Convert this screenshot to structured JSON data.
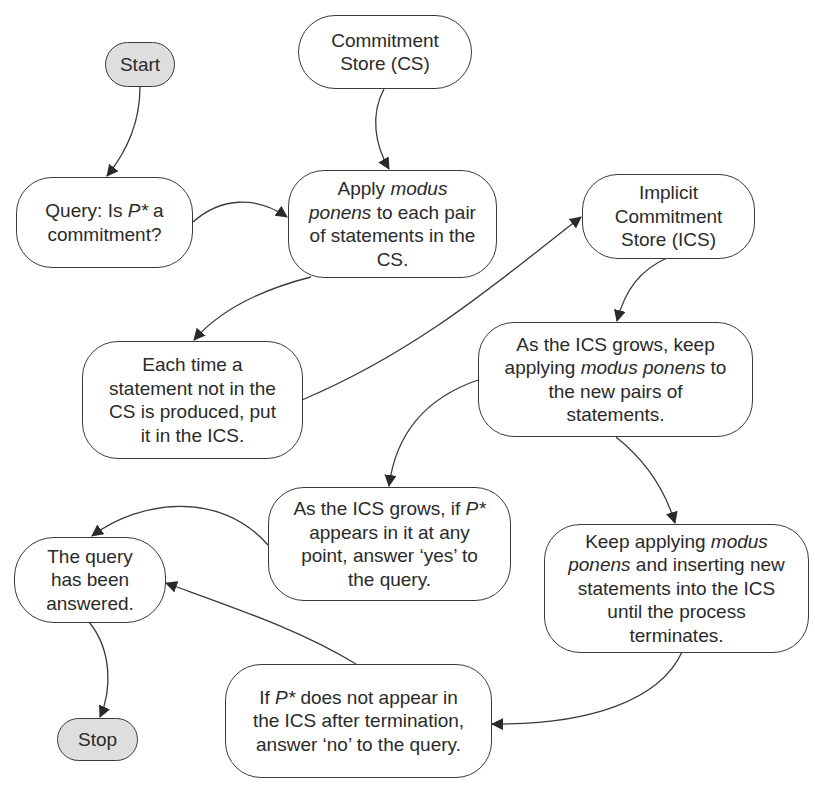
{
  "diagram": {
    "type": "flowchart",
    "colors": {
      "stroke": "#3a3a3a",
      "terminal_fill": "#dedede",
      "process_fill": "#ffffff",
      "text": "#2a2a2a"
    },
    "nodes": {
      "start": {
        "label": "Start",
        "kind": "terminal"
      },
      "cs": {
        "label": "Commitment Store (CS)",
        "kind": "store"
      },
      "query": {
        "label": "Query: Is P* a commitment?",
        "kind": "process"
      },
      "apply": {
        "label": "Apply modus ponens to each pair of statements in the CS.",
        "kind": "process"
      },
      "ics": {
        "label": "Implicit Commitment Store (ICS)",
        "kind": "store"
      },
      "each_time": {
        "label": "Each time a statement not in the CS is produced, put it in the ICS.",
        "kind": "process"
      },
      "ics_grows": {
        "label": "As the ICS grows, keep applying modus ponens to the new pairs of statements.",
        "kind": "process"
      },
      "yes": {
        "label": "As the ICS grows, if P* appears in it at any point, answer 'yes' to the query.",
        "kind": "process"
      },
      "keep": {
        "label": "Keep applying modus ponens and inserting new statements into the ICS until the process terminates.",
        "kind": "process"
      },
      "answered": {
        "label": "The query has been answered.",
        "kind": "process"
      },
      "no": {
        "label": "If P* does not appear in the ICS after termination, answer 'no' to the query.",
        "kind": "process"
      },
      "stop": {
        "label": "Stop",
        "kind": "terminal"
      }
    },
    "label_parts": {
      "start": [
        "Start"
      ],
      "cs": [
        "Commitment",
        "Store (CS)"
      ],
      "query": [
        [
          "Query: Is ",
          ""
        ],
        [
          "P*",
          "i"
        ],
        [
          " a",
          ""
        ],
        [
          "|",
          ""
        ],
        [
          "commitment?",
          ""
        ]
      ],
      "apply": [
        [
          "Apply ",
          ""
        ],
        [
          "modus",
          "i"
        ],
        [
          "|",
          ""
        ],
        [
          "ponens",
          "i"
        ],
        [
          " to each pair",
          ""
        ],
        [
          "|",
          ""
        ],
        [
          "of statements in the",
          ""
        ],
        [
          "|",
          ""
        ],
        [
          "CS.",
          ""
        ]
      ],
      "ics": [
        "Implicit",
        "Commitment",
        "Store (ICS)"
      ],
      "each_time": [
        "Each time a",
        "statement not in the",
        "CS is produced, put",
        "it in the ICS."
      ],
      "ics_grows": [
        [
          "As the ICS grows, keep",
          ""
        ],
        [
          "|",
          ""
        ],
        [
          "applying ",
          ""
        ],
        [
          "modus ponens",
          "i"
        ],
        [
          " to",
          ""
        ],
        [
          "|",
          ""
        ],
        [
          "the new pairs of",
          ""
        ],
        [
          "|",
          ""
        ],
        [
          "statements.",
          ""
        ]
      ],
      "yes": [
        [
          "As the ICS grows, if ",
          ""
        ],
        [
          "P*",
          "i"
        ],
        [
          "|",
          ""
        ],
        [
          "appears in it at any",
          ""
        ],
        [
          "|",
          ""
        ],
        [
          "point, answer ‘yes’ to",
          ""
        ],
        [
          "|",
          ""
        ],
        [
          "the query.",
          ""
        ]
      ],
      "keep": [
        [
          "Keep applying ",
          ""
        ],
        [
          "modus",
          "i"
        ],
        [
          "|",
          ""
        ],
        [
          "ponens",
          "i"
        ],
        [
          " and inserting new",
          ""
        ],
        [
          "|",
          ""
        ],
        [
          "statements into the ICS",
          ""
        ],
        [
          "|",
          ""
        ],
        [
          "until the process",
          ""
        ],
        [
          "|",
          ""
        ],
        [
          "terminates.",
          ""
        ]
      ],
      "answered": [
        "The query",
        "has been",
        "answered."
      ],
      "no": [
        [
          "If ",
          ""
        ],
        [
          "P*",
          "i"
        ],
        [
          " does not appear in",
          ""
        ],
        [
          "|",
          ""
        ],
        [
          "the ICS after termination,",
          ""
        ],
        [
          "|",
          ""
        ],
        [
          "answer ‘no’ to the query.",
          ""
        ]
      ],
      "stop": [
        "Stop"
      ]
    },
    "edges": [
      {
        "from": "start",
        "to": "query"
      },
      {
        "from": "cs",
        "to": "apply"
      },
      {
        "from": "query",
        "to": "apply"
      },
      {
        "from": "apply",
        "to": "each_time"
      },
      {
        "from": "each_time",
        "to": "ics"
      },
      {
        "from": "ics",
        "to": "ics_grows"
      },
      {
        "from": "ics_grows",
        "to": "yes"
      },
      {
        "from": "ics_grows",
        "to": "keep"
      },
      {
        "from": "yes",
        "to": "answered"
      },
      {
        "from": "keep",
        "to": "no"
      },
      {
        "from": "no",
        "to": "answered"
      },
      {
        "from": "answered",
        "to": "stop"
      }
    ]
  }
}
